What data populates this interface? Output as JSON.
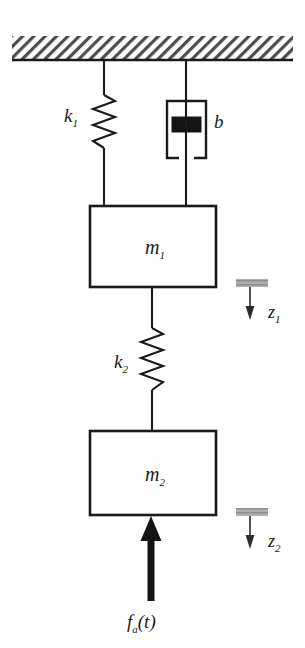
{
  "figure": {
    "type": "mechanical-schematic",
    "background_color": "#ffffff",
    "line_color": "#1a1a1a",
    "hatch_color": "#4d4d4d",
    "reference_bar_color": "#a6a6a6"
  },
  "ceiling": {
    "name": "fixed-support",
    "hatching": "diagonal",
    "x": 12,
    "y": 36,
    "width": 281,
    "height": 24
  },
  "elements": {
    "spring_k1": {
      "label": "k",
      "subscript": "1",
      "label_x": 70,
      "label_y": 116,
      "center_x": 104,
      "top_y": 60,
      "coil_start_y": 94,
      "coil_end_y": 150,
      "bottom_y": 206,
      "coils": 7,
      "amplitude": 11
    },
    "damper_b": {
      "label": "b",
      "subscript": "",
      "label_x": 218,
      "label_y": 122,
      "center_x": 186,
      "top_y": 60,
      "cup_left": 167,
      "cup_right": 206,
      "cup_top": 101,
      "cup_bottom": 158,
      "cup_gap": 11,
      "piston_left": 172,
      "piston_right": 201,
      "piston_top": 117,
      "piston_bottom": 132,
      "bottom_y": 206
    },
    "mass_m1": {
      "label": "m",
      "subscript": "1",
      "x": 90,
      "y": 206,
      "width": 126,
      "height": 81,
      "label_x": 153,
      "label_y": 252
    },
    "spring_k2": {
      "label": "k",
      "subscript": "2",
      "label_x": 120,
      "label_y": 362,
      "center_x": 152,
      "top_y": 287,
      "coil_start_y": 327,
      "coil_end_y": 392,
      "bottom_y": 431,
      "coils": 8,
      "amplitude": 11
    },
    "mass_m2": {
      "label": "m",
      "subscript": "2",
      "x": 90,
      "y": 431,
      "width": 126,
      "height": 84,
      "label_x": 153,
      "label_y": 479
    },
    "force_fa": {
      "label_f": "f",
      "label_sub": "a",
      "label_paren": "(t)",
      "label_x": 151,
      "label_y": 622,
      "center_x": 151,
      "tail_y": 601,
      "head_y": 516,
      "shaft_width": 7,
      "head_width": 21,
      "head_height": 25
    }
  },
  "references": {
    "z1": {
      "label": "z",
      "subscript": "1",
      "bar_x": 236,
      "bar_y": 279,
      "bar_width": 32,
      "bar_height": 8,
      "arrow_x": 250,
      "arrow_top_y": 287,
      "arrow_bottom_y": 319,
      "label_x": 274,
      "label_y": 313
    },
    "z2": {
      "label": "z",
      "subscript": "2",
      "bar_x": 236,
      "bar_y": 508,
      "bar_width": 32,
      "bar_height": 8,
      "arrow_x": 250,
      "arrow_top_y": 516,
      "arrow_bottom_y": 548,
      "label_x": 274,
      "label_y": 542
    }
  },
  "labels": {
    "k1_text": "k",
    "k1_sub": "1",
    "b_text": "b",
    "m1_text": "m",
    "m1_sub": "1",
    "k2_text": "k",
    "k2_sub": "2",
    "m2_text": "m",
    "m2_sub": "2",
    "z1_text": "z",
    "z1_sub": "1",
    "z2_text": "z",
    "z2_sub": "2",
    "fa_text": "f",
    "fa_sub": "a",
    "fa_arg": "(t)"
  }
}
